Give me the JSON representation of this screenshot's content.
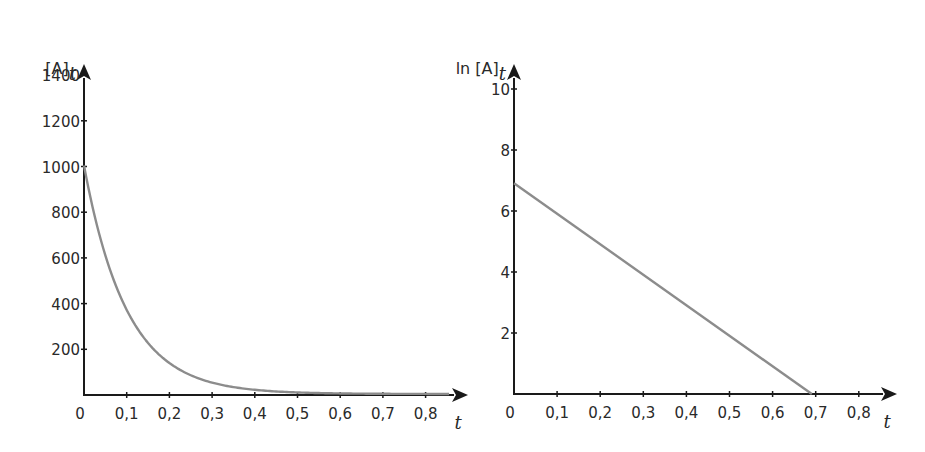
{
  "chart_data": [
    {
      "type": "line",
      "title": "",
      "xlabel": "t",
      "ylabel": "[A]_t",
      "ylabel_main": "[A]",
      "ylabel_sub": "t",
      "xlim": [
        0,
        0.88
      ],
      "ylim": [
        0,
        1500
      ],
      "x_ticks": [
        "0",
        "0,1",
        "0,2",
        "0,3",
        "0,4",
        "0,5",
        "0,6",
        "0,7",
        "0,8"
      ],
      "x_tick_values": [
        0,
        0.1,
        0.2,
        0.3,
        0.4,
        0.5,
        0.6,
        0.7,
        0.8
      ],
      "y_ticks": [
        "200",
        "400",
        "600",
        "800",
        "1000",
        "1200",
        "1400"
      ],
      "y_tick_values": [
        200,
        400,
        600,
        800,
        1000,
        1200,
        1400
      ],
      "grid": false,
      "legend": null,
      "series": [
        {
          "name": "[A]_t = 1000·e^(−10t)",
          "color": "#8c8c8c",
          "x": [
            0,
            0.05,
            0.1,
            0.15,
            0.2,
            0.25,
            0.3,
            0.35,
            0.4,
            0.45,
            0.5,
            0.55,
            0.6,
            0.65,
            0.7,
            0.75,
            0.8,
            0.85
          ],
          "values": [
            1000,
            607,
            368,
            223,
            135,
            82,
            50,
            30,
            18,
            11,
            7,
            4,
            2.5,
            1.5,
            0.9,
            0.6,
            0.3,
            0.2
          ]
        }
      ]
    },
    {
      "type": "line",
      "title": "",
      "xlabel": "t",
      "ylabel": "ln [A]_t",
      "ylabel_main": "ln [A]",
      "ylabel_sub": "t",
      "xlim": [
        0,
        0.88
      ],
      "ylim": [
        0,
        11.5
      ],
      "x_ticks": [
        "0",
        "0,1",
        "0,2",
        "0,3",
        "0,4",
        "0,5",
        "0,6",
        "0,7",
        "0,8"
      ],
      "x_tick_values": [
        0,
        0.1,
        0.2,
        0.3,
        0.4,
        0.5,
        0.6,
        0.7,
        0.8
      ],
      "y_ticks": [
        "2",
        "4",
        "6",
        "8",
        "10"
      ],
      "y_tick_values": [
        2,
        4,
        6,
        8,
        10
      ],
      "grid": false,
      "legend": null,
      "series": [
        {
          "name": "ln [A]_t = 6.91 − 10t",
          "color": "#8c8c8c",
          "x": [
            0,
            0.691
          ],
          "values": [
            6.91,
            0
          ]
        }
      ]
    }
  ]
}
